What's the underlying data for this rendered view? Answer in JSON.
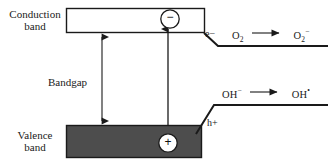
{
  "diagram": {
    "colors": {
      "stroke": "#1a1a1a",
      "valence_band_fill": "#4d4d4d",
      "conduction_band_fill": "#ffffff",
      "carrier_circle_fill": "#ffffff",
      "background": "#ffffff"
    },
    "labels": {
      "conduction_band": "Conduction\nband",
      "conduction_band_line1": "Conduction",
      "conduction_band_line2": "band",
      "valence_band_line1": "Valence",
      "valence_band_line2": "band",
      "bandgap": "Bandgap",
      "electron_carrier": "e",
      "electron_carrier_charge": "−",
      "hole_carrier": "h",
      "hole_carrier_charge": "+",
      "electron_sign": "−",
      "hole_sign": "+"
    },
    "reactions": {
      "top": {
        "reactant": "O",
        "reactant_sub": "2",
        "arrow": "⟶",
        "product": "O",
        "product_sub": "2",
        "product_charge": "−",
        "full_text": "O2 ⟶ O2−"
      },
      "bottom": {
        "reactant": "OH",
        "reactant_charge": "−",
        "arrow": "⟶",
        "product": "OH",
        "product_charge": "•",
        "full_text": "OH− ⟶ OH•"
      }
    },
    "geometry": {
      "conduction_band_box": {
        "x": 66,
        "y": 8,
        "width": 139,
        "height": 25
      },
      "valence_band_box": {
        "x": 66,
        "y": 125,
        "width": 136,
        "height": 33
      },
      "bandgap_arrow_x": 102,
      "excitation_arrow_x": 168,
      "electron_level_line_y": 46,
      "hole_level_line_y": 105
    }
  }
}
